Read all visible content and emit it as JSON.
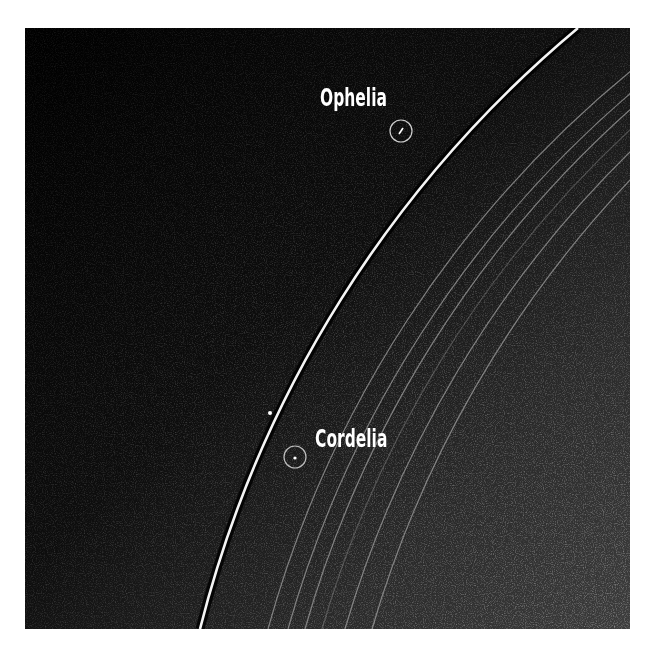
{
  "image": {
    "subject": "Planetary ring arc with two small moons circled against a starry/noisy background",
    "colors": {
      "page_background": "#ffffff",
      "space_dark": "#050505",
      "space_gray": "#3a3a3a",
      "main_ring": "#f2f2f2",
      "faint_rings": "#9a9a9a",
      "label_text": "#ffffff",
      "marker_circle": "#c8c8c8"
    }
  },
  "labels": {
    "ophelia": "Ophelia",
    "cordelia": "Cordelia"
  },
  "markers": [
    {
      "name": "Ophelia",
      "cx": 401,
      "cy": 131,
      "r": 11
    },
    {
      "name": "Cordelia",
      "cx": 295,
      "cy": 457,
      "r": 11
    }
  ],
  "rings": {
    "main_count": 1,
    "faint_count": 6
  }
}
